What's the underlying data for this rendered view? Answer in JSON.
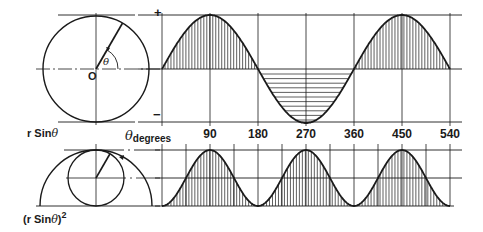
{
  "diagram": {
    "colors": {
      "ink": "#1a1a1a",
      "background": "#ffffff"
    },
    "top_panel": {
      "label_function": "r Sin",
      "label_theta": "θ",
      "origin_label": "O",
      "angle_label": "θ",
      "plus_sign": "+",
      "minus_sign": "−",
      "circle": {
        "cx": 96,
        "cy": 69,
        "r": 53,
        "radius_angle_deg": 60
      },
      "graph": {
        "x0": 162,
        "x1": 450,
        "y_top": 15,
        "y_mid": 69,
        "y_bot": 122
      },
      "positive_hatching": "vertical",
      "negative_hatching": "horizontal"
    },
    "axis": {
      "label": "θ",
      "label_sub": "degrees",
      "ticks": [
        "90",
        "180",
        "270",
        "360",
        "450",
        "540"
      ],
      "tick_values": [
        90,
        180,
        270,
        360,
        450,
        540
      ]
    },
    "bottom_panel": {
      "label_prefix": "(r Sin",
      "label_theta": "θ",
      "label_suffix": ")",
      "label_power": "2",
      "semicircle": {
        "cx": 96,
        "cy": 206,
        "r": 56
      },
      "small_circle": {
        "cx": 96,
        "cy": 178,
        "r": 28
      },
      "graph": {
        "x0": 162,
        "x1": 450,
        "y_top": 150,
        "y_mid": 178,
        "y_bot": 206
      },
      "hatching": "vertical"
    }
  },
  "chart_data": [
    {
      "type": "line",
      "title": "r Sin θ",
      "xlabel": "θ degrees",
      "x_ticks": [
        90,
        180,
        270,
        360,
        450,
        540
      ],
      "xlim": [
        0,
        540
      ],
      "ylim": [
        -1,
        1
      ],
      "x": [
        0,
        45,
        90,
        135,
        180,
        225,
        270,
        315,
        360,
        405,
        450,
        495,
        540
      ],
      "values": [
        0,
        0.707,
        1,
        0.707,
        0,
        -0.707,
        -1,
        -0.707,
        0,
        0.707,
        1,
        0.707,
        0
      ]
    },
    {
      "type": "line",
      "title": "(r Sin θ)²",
      "xlabel": "θ degrees",
      "x_ticks": [
        90,
        180,
        270,
        360,
        450,
        540
      ],
      "xlim": [
        0,
        540
      ],
      "ylim": [
        0,
        1
      ],
      "x": [
        0,
        45,
        90,
        135,
        180,
        225,
        270,
        315,
        360,
        405,
        450,
        495,
        540
      ],
      "values": [
        0,
        0.5,
        1,
        0.5,
        0,
        0.5,
        1,
        0.5,
        0,
        0.5,
        1,
        0.5,
        0
      ]
    }
  ]
}
